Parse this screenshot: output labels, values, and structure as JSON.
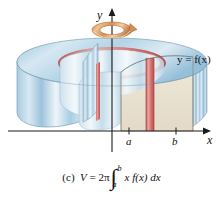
{
  "figure": {
    "kind": "shell-method-solid-of-revolution",
    "background_color": "#ffffff",
    "axes": {
      "y_axis_label": "y",
      "x_axis_label": "x",
      "tick_labels": [
        "a",
        "b"
      ],
      "axis_color": "#1a1a1a"
    },
    "curve_label": "y = f(x)",
    "rotation_arrow": {
      "name": "rotation-arrow-ring",
      "color": "#d08a4e",
      "highlight_color": "#f0c79a"
    },
    "solid": {
      "outer_surface_color": "#bcd9ea",
      "top_surface_color": "#cfe4f0",
      "inner_wall_color": "#dbe9f2",
      "cut_face_color": "#e9e2d2",
      "shell_color": "#d9726e",
      "shell_highlight_color": "#e8a09c",
      "edge_color": "#7f8f9a"
    }
  },
  "caption": {
    "part_label": "(c)",
    "volume_symbol": "V",
    "equals": "=",
    "coefficient": "2π",
    "integral_symbol": "∫",
    "lower_limit": "a",
    "upper_limit": "b",
    "integrand": "x f(x) dx",
    "full_text": "(c)  V = 2π ∫ₐᵇ x f(x) dx"
  }
}
